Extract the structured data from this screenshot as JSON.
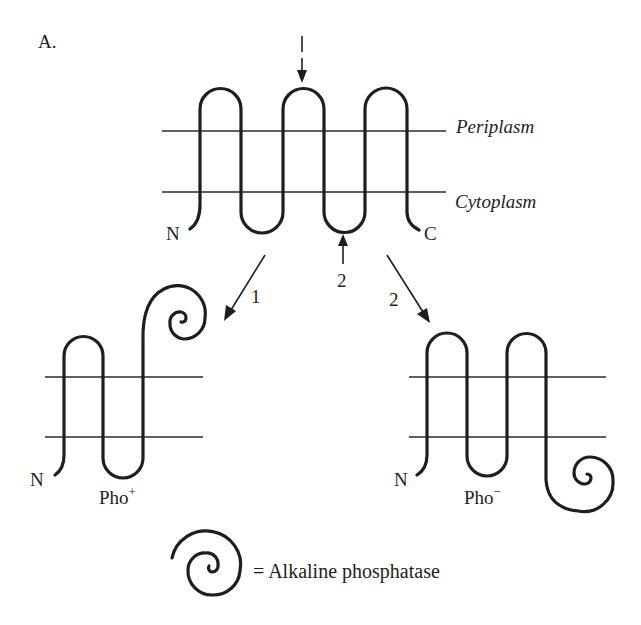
{
  "figure": {
    "panel_label": "A.",
    "top_topology": {
      "n_terminus": "N",
      "c_terminus": "C",
      "periplasm_label": "Periplasm",
      "cytoplasm_label": "Cytoplasm",
      "fusion_site_periplasmic": "1",
      "fusion_site_cytoplasmic": "2"
    },
    "arrows": {
      "left_label": "1",
      "right_label": "2"
    },
    "fusion_left": {
      "n_terminus": "N",
      "phenotype": "Pho",
      "phenotype_sign": "+"
    },
    "fusion_right": {
      "n_terminus": "N",
      "phenotype": "Pho",
      "phenotype_sign": "−"
    },
    "legend": {
      "symbol": "spiral",
      "text": "= Alkaline phosphatase"
    },
    "colors": {
      "ink": "#1e1e1e",
      "background": "#ffffff"
    }
  }
}
